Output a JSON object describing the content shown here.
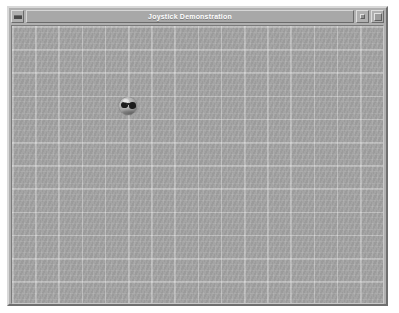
{
  "window": {
    "title": "Joystick Demonstration",
    "frame_color": "#b0b0b0",
    "titlebar_color": "#a8a8a8",
    "title_text_color": "#ffffff",
    "controls": {
      "menu_button_label": "",
      "menu_button_icon": "window-menu-dash-icon",
      "minimize_button_label": "",
      "minimize_button_icon": "minimize-icon",
      "maximize_button_label": "",
      "maximize_button_icon": "maximize-icon"
    }
  },
  "canvas": {
    "name": "joystick-canvas",
    "background_color": "#a1a1a1",
    "gridline_color": "#b6b6b6",
    "grid_major_spacing_px": 23,
    "grid_minor_spacing_px": 6,
    "width_px": 375,
    "height_px": 279
  },
  "cursor": {
    "name": "joystick-ball-cursor",
    "icon": "sphere-ball-icon",
    "diameter_px": 18,
    "position": {
      "x": 107,
      "y": 71
    },
    "center": {
      "x": 116,
      "y": 80
    },
    "highlight_color": "#d8d8d8",
    "shade_color": "#4e4e4e",
    "marking_color": "#1c1c1c"
  },
  "desktop": {
    "background_color": "#ffffff"
  }
}
